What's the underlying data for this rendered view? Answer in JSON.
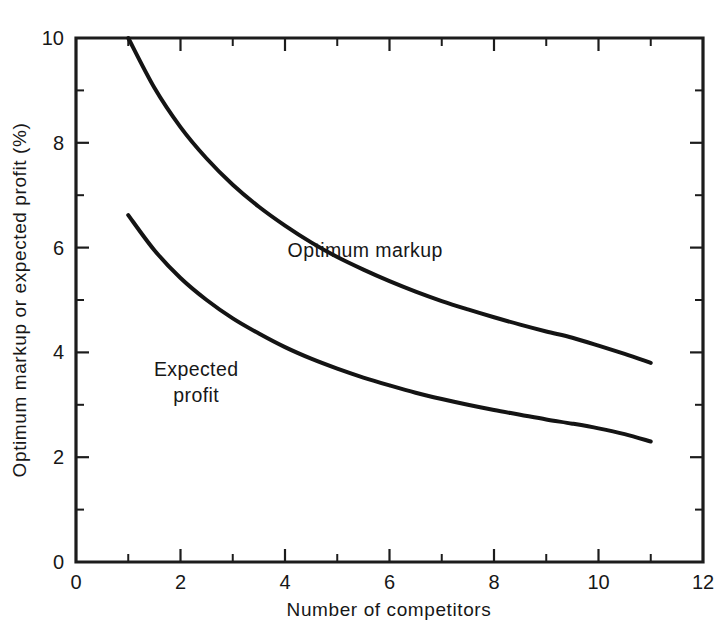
{
  "chart_data": {
    "type": "line",
    "title": "",
    "xlabel": "Number of competitors",
    "ylabel": "Optimum markup or expected profit (%)",
    "xlim": [
      0,
      12
    ],
    "ylim": [
      0,
      10
    ],
    "grid": false,
    "legend_position": "inline-labels",
    "x_major_ticks": [
      0,
      2,
      4,
      6,
      8,
      10,
      12
    ],
    "x_minor_ticks": [
      1,
      3,
      5,
      7,
      9,
      11
    ],
    "x_tick_labels": [
      "0",
      "2",
      "4",
      "6",
      "8",
      "10",
      "12"
    ],
    "y_major_ticks": [
      0,
      2,
      4,
      6,
      8,
      10
    ],
    "y_minor_ticks": [
      1,
      3,
      5,
      7,
      9
    ],
    "y_tick_labels": [
      "0",
      "2",
      "4",
      "6",
      "8",
      "10"
    ],
    "x": [
      1,
      1.5,
      2,
      2.5,
      3,
      3.5,
      4,
      4.5,
      5,
      5.5,
      6,
      6.5,
      7,
      7.5,
      8,
      8.5,
      9,
      9.5,
      10,
      10.5,
      11
    ],
    "series": [
      {
        "name": "Optimum markup",
        "label_x": 4.05,
        "label_y": 5.82,
        "values": [
          10.0,
          9.05,
          8.3,
          7.7,
          7.2,
          6.78,
          6.42,
          6.1,
          5.82,
          5.58,
          5.36,
          5.16,
          4.98,
          4.82,
          4.67,
          4.53,
          4.4,
          4.28,
          4.13,
          3.97,
          3.8
        ]
      },
      {
        "name": "Expected profit",
        "label_line1": "Expected",
        "label_line2": "profit",
        "label_x": 2.3,
        "label_y": 3.55,
        "values": [
          6.62,
          5.95,
          5.42,
          5.0,
          4.65,
          4.36,
          4.1,
          3.88,
          3.69,
          3.52,
          3.37,
          3.23,
          3.11,
          3.0,
          2.9,
          2.81,
          2.72,
          2.64,
          2.55,
          2.44,
          2.3
        ]
      }
    ]
  },
  "colors": {
    "axis": "#1c1c1c",
    "curve": "#141414",
    "background": "#ffffff",
    "text": "#171717"
  }
}
